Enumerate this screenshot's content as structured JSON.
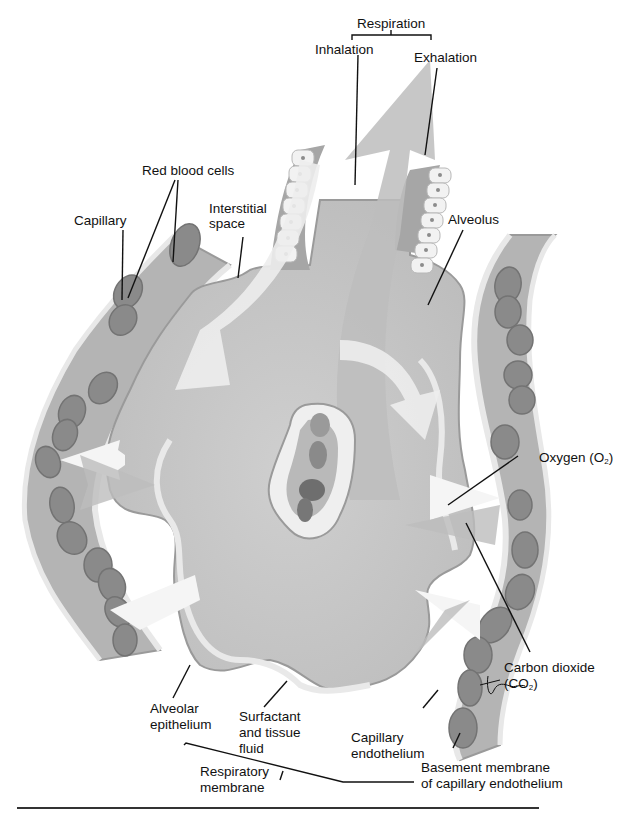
{
  "figure": {
    "colors": {
      "alveolus_fill": "#c9c9c9",
      "alveolus_dark": "#a9a9a9",
      "capillary_fill": "#b4b4b4",
      "rbc_fill": "#8a8a8a",
      "rbc_dark": "#6e6e6e",
      "epithelium_fill": "#eeeeee",
      "arrow_light": "#f3f3f3",
      "arrow_dark": "#b8b8b8",
      "leader_line": "#111111"
    },
    "labels": {
      "respiration": "Respiration",
      "inhalation": "Inhalation",
      "exhalation": "Exhalation",
      "red_blood_cells": "Red blood cells",
      "capillary": "Capillary",
      "interstitial_space_1": "Interstitial",
      "interstitial_space_2": "space",
      "alveolus": "Alveolus",
      "oxygen": "Oxygen (O",
      "oxygen_sub": "2",
      "oxygen_end": ")",
      "carbon_dioxide_1": "Carbon dioxide",
      "carbon_dioxide_2": "(CO",
      "carbon_dioxide_sub": "2",
      "carbon_dioxide_end": ")",
      "alveolar_epithelium_1": "Alveolar",
      "alveolar_epithelium_2": "epithelium",
      "surfactant_1": "Surfactant",
      "surfactant_2": "and tissue",
      "surfactant_3": "fluid",
      "capillary_endothelium_1": "Capillary",
      "capillary_endothelium_2": "endothelium",
      "basement_membrane_1": "Basement membrane",
      "basement_membrane_2": "of capillary endothelium",
      "respiratory_membrane_1": "Respiratory",
      "respiratory_membrane_2": "membrane",
      "signature": "tina"
    }
  }
}
